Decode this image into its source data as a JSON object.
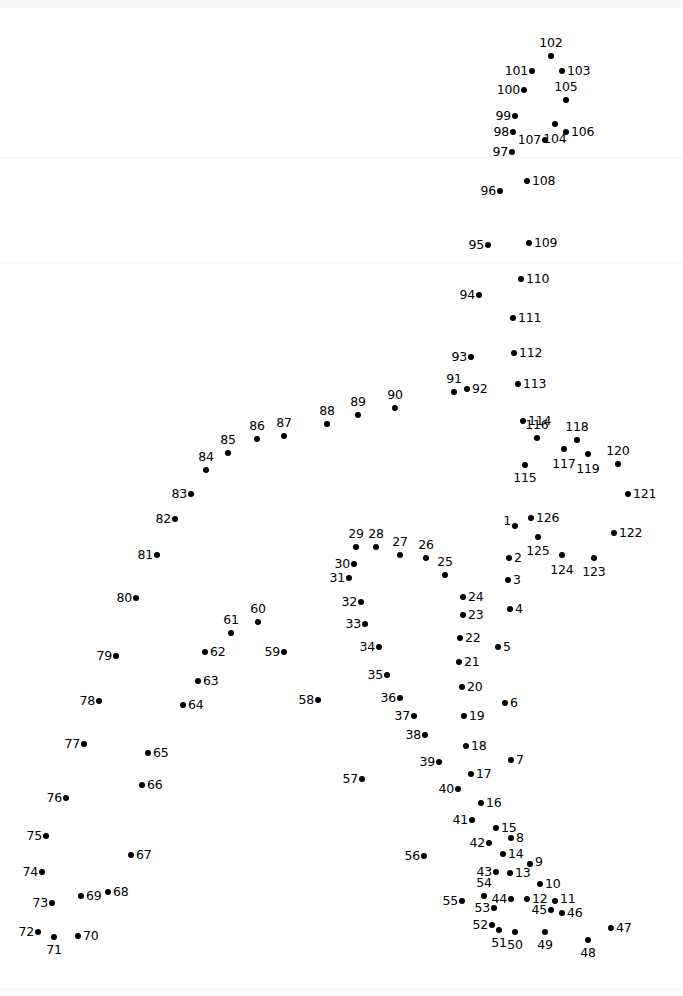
{
  "page": {
    "type": "connect-the-dots-puzzle",
    "width": 683,
    "height": 996,
    "background_color": "#ffffff",
    "dot_color": "#000000",
    "label_color": "#000000",
    "total_dots": 126
  },
  "dots": [
    {
      "n": "1",
      "x": 515,
      "y": 526,
      "lx": 511,
      "ly": 521,
      "pos": "left"
    },
    {
      "n": "2",
      "x": 509,
      "y": 558,
      "lx": 514,
      "ly": 558,
      "pos": "right"
    },
    {
      "n": "3",
      "x": 508,
      "y": 580,
      "lx": 513,
      "ly": 580,
      "pos": "right"
    },
    {
      "n": "4",
      "x": 510,
      "y": 609,
      "lx": 515,
      "ly": 609,
      "pos": "right"
    },
    {
      "n": "5",
      "x": 498,
      "y": 647,
      "lx": 503,
      "ly": 647,
      "pos": "right"
    },
    {
      "n": "6",
      "x": 505,
      "y": 703,
      "lx": 510,
      "ly": 703,
      "pos": "right"
    },
    {
      "n": "7",
      "x": 511,
      "y": 760,
      "lx": 516,
      "ly": 760,
      "pos": "right"
    },
    {
      "n": "8",
      "x": 511,
      "y": 838,
      "lx": 516,
      "ly": 838,
      "pos": "right"
    },
    {
      "n": "9",
      "x": 530,
      "y": 864,
      "lx": 535,
      "ly": 862,
      "pos": "right"
    },
    {
      "n": "10",
      "x": 540,
      "y": 884,
      "lx": 545,
      "ly": 884,
      "pos": "right"
    },
    {
      "n": "11",
      "x": 555,
      "y": 901,
      "lx": 560,
      "ly": 899,
      "pos": "right"
    },
    {
      "n": "12",
      "x": 527,
      "y": 899,
      "lx": 532,
      "ly": 899,
      "pos": "right"
    },
    {
      "n": "13",
      "x": 510,
      "y": 873,
      "lx": 515,
      "ly": 873,
      "pos": "right"
    },
    {
      "n": "14",
      "x": 503,
      "y": 854,
      "lx": 508,
      "ly": 854,
      "pos": "right"
    },
    {
      "n": "15",
      "x": 496,
      "y": 828,
      "lx": 501,
      "ly": 828,
      "pos": "right"
    },
    {
      "n": "16",
      "x": 481,
      "y": 803,
      "lx": 486,
      "ly": 803,
      "pos": "right"
    },
    {
      "n": "17",
      "x": 471,
      "y": 774,
      "lx": 476,
      "ly": 774,
      "pos": "right"
    },
    {
      "n": "18",
      "x": 466,
      "y": 746,
      "lx": 471,
      "ly": 746,
      "pos": "right"
    },
    {
      "n": "19",
      "x": 464,
      "y": 716,
      "lx": 469,
      "ly": 716,
      "pos": "right"
    },
    {
      "n": "20",
      "x": 462,
      "y": 687,
      "lx": 467,
      "ly": 687,
      "pos": "right"
    },
    {
      "n": "21",
      "x": 459,
      "y": 662,
      "lx": 464,
      "ly": 662,
      "pos": "right"
    },
    {
      "n": "22",
      "x": 460,
      "y": 638,
      "lx": 465,
      "ly": 638,
      "pos": "right"
    },
    {
      "n": "23",
      "x": 463,
      "y": 615,
      "lx": 468,
      "ly": 615,
      "pos": "right"
    },
    {
      "n": "24",
      "x": 463,
      "y": 597,
      "lx": 468,
      "ly": 597,
      "pos": "right"
    },
    {
      "n": "25",
      "x": 445,
      "y": 575,
      "lx": 445,
      "ly": 568,
      "pos": "above"
    },
    {
      "n": "26",
      "x": 426,
      "y": 558,
      "lx": 426,
      "ly": 551,
      "pos": "above"
    },
    {
      "n": "27",
      "x": 400,
      "y": 555,
      "lx": 400,
      "ly": 548,
      "pos": "above"
    },
    {
      "n": "28",
      "x": 376,
      "y": 547,
      "lx": 376,
      "ly": 540,
      "pos": "above"
    },
    {
      "n": "29",
      "x": 356,
      "y": 547,
      "lx": 356,
      "ly": 540,
      "pos": "above"
    },
    {
      "n": "30",
      "x": 354,
      "y": 564,
      "lx": 350,
      "ly": 564,
      "pos": "left"
    },
    {
      "n": "31",
      "x": 349,
      "y": 578,
      "lx": 345,
      "ly": 578,
      "pos": "left"
    },
    {
      "n": "32",
      "x": 361,
      "y": 602,
      "lx": 357,
      "ly": 602,
      "pos": "left"
    },
    {
      "n": "33",
      "x": 365,
      "y": 624,
      "lx": 361,
      "ly": 624,
      "pos": "left"
    },
    {
      "n": "34",
      "x": 379,
      "y": 647,
      "lx": 375,
      "ly": 647,
      "pos": "left"
    },
    {
      "n": "35",
      "x": 387,
      "y": 675,
      "lx": 383,
      "ly": 675,
      "pos": "left"
    },
    {
      "n": "36",
      "x": 400,
      "y": 698,
      "lx": 396,
      "ly": 698,
      "pos": "left"
    },
    {
      "n": "37",
      "x": 414,
      "y": 716,
      "lx": 410,
      "ly": 716,
      "pos": "left"
    },
    {
      "n": "38",
      "x": 425,
      "y": 735,
      "lx": 421,
      "ly": 735,
      "pos": "left"
    },
    {
      "n": "39",
      "x": 439,
      "y": 762,
      "lx": 435,
      "ly": 762,
      "pos": "left"
    },
    {
      "n": "40",
      "x": 458,
      "y": 789,
      "lx": 454,
      "ly": 789,
      "pos": "left"
    },
    {
      "n": "41",
      "x": 472,
      "y": 820,
      "lx": 468,
      "ly": 820,
      "pos": "left"
    },
    {
      "n": "42",
      "x": 489,
      "y": 843,
      "lx": 485,
      "ly": 843,
      "pos": "left"
    },
    {
      "n": "43",
      "x": 496,
      "y": 872,
      "lx": 492,
      "ly": 872,
      "pos": "left"
    },
    {
      "n": "44",
      "x": 511,
      "y": 899,
      "lx": 507,
      "ly": 899,
      "pos": "left"
    },
    {
      "n": "45",
      "x": 551,
      "y": 910,
      "lx": 547,
      "ly": 910,
      "pos": "left"
    },
    {
      "n": "46",
      "x": 562,
      "y": 913,
      "lx": 567,
      "ly": 913,
      "pos": "right"
    },
    {
      "n": "47",
      "x": 611,
      "y": 928,
      "lx": 616,
      "ly": 928,
      "pos": "right"
    },
    {
      "n": "48",
      "x": 588,
      "y": 940,
      "lx": 588,
      "ly": 947,
      "pos": "below"
    },
    {
      "n": "49",
      "x": 545,
      "y": 932,
      "lx": 545,
      "ly": 939,
      "pos": "below"
    },
    {
      "n": "50",
      "x": 515,
      "y": 932,
      "lx": 515,
      "ly": 939,
      "pos": "below"
    },
    {
      "n": "51",
      "x": 499,
      "y": 930,
      "lx": 499,
      "ly": 937,
      "pos": "below"
    },
    {
      "n": "52",
      "x": 492,
      "y": 925,
      "lx": 488,
      "ly": 925,
      "pos": "left"
    },
    {
      "n": "53",
      "x": 494,
      "y": 908,
      "lx": 490,
      "ly": 908,
      "pos": "left"
    },
    {
      "n": "54",
      "x": 484,
      "y": 896,
      "lx": 484,
      "ly": 889,
      "pos": "above"
    },
    {
      "n": "55",
      "x": 462,
      "y": 901,
      "lx": 458,
      "ly": 901,
      "pos": "left"
    },
    {
      "n": "56",
      "x": 424,
      "y": 856,
      "lx": 420,
      "ly": 856,
      "pos": "left"
    },
    {
      "n": "57",
      "x": 362,
      "y": 779,
      "lx": 358,
      "ly": 779,
      "pos": "left"
    },
    {
      "n": "58",
      "x": 318,
      "y": 700,
      "lx": 314,
      "ly": 700,
      "pos": "left"
    },
    {
      "n": "59",
      "x": 284,
      "y": 652,
      "lx": 280,
      "ly": 652,
      "pos": "left"
    },
    {
      "n": "60",
      "x": 258,
      "y": 622,
      "lx": 258,
      "ly": 615,
      "pos": "above"
    },
    {
      "n": "61",
      "x": 231,
      "y": 633,
      "lx": 231,
      "ly": 626,
      "pos": "above"
    },
    {
      "n": "62",
      "x": 205,
      "y": 652,
      "lx": 210,
      "ly": 652,
      "pos": "right"
    },
    {
      "n": "63",
      "x": 198,
      "y": 681,
      "lx": 203,
      "ly": 681,
      "pos": "right"
    },
    {
      "n": "64",
      "x": 183,
      "y": 705,
      "lx": 188,
      "ly": 705,
      "pos": "right"
    },
    {
      "n": "65",
      "x": 148,
      "y": 753,
      "lx": 153,
      "ly": 753,
      "pos": "right"
    },
    {
      "n": "66",
      "x": 142,
      "y": 785,
      "lx": 147,
      "ly": 785,
      "pos": "right"
    },
    {
      "n": "67",
      "x": 131,
      "y": 855,
      "lx": 136,
      "ly": 855,
      "pos": "right"
    },
    {
      "n": "68",
      "x": 108,
      "y": 892,
      "lx": 113,
      "ly": 892,
      "pos": "right"
    },
    {
      "n": "69",
      "x": 81,
      "y": 896,
      "lx": 86,
      "ly": 896,
      "pos": "right"
    },
    {
      "n": "70",
      "x": 78,
      "y": 936,
      "lx": 83,
      "ly": 936,
      "pos": "right"
    },
    {
      "n": "71",
      "x": 54,
      "y": 937,
      "lx": 54,
      "ly": 944,
      "pos": "below"
    },
    {
      "n": "72",
      "x": 38,
      "y": 932,
      "lx": 34,
      "ly": 932,
      "pos": "left"
    },
    {
      "n": "73",
      "x": 52,
      "y": 903,
      "lx": 48,
      "ly": 903,
      "pos": "left"
    },
    {
      "n": "74",
      "x": 42,
      "y": 872,
      "lx": 38,
      "ly": 872,
      "pos": "left"
    },
    {
      "n": "75",
      "x": 46,
      "y": 836,
      "lx": 42,
      "ly": 836,
      "pos": "left"
    },
    {
      "n": "76",
      "x": 66,
      "y": 798,
      "lx": 62,
      "ly": 798,
      "pos": "left"
    },
    {
      "n": "77",
      "x": 84,
      "y": 744,
      "lx": 80,
      "ly": 744,
      "pos": "left"
    },
    {
      "n": "78",
      "x": 99,
      "y": 701,
      "lx": 95,
      "ly": 701,
      "pos": "left"
    },
    {
      "n": "79",
      "x": 116,
      "y": 656,
      "lx": 112,
      "ly": 656,
      "pos": "left"
    },
    {
      "n": "80",
      "x": 136,
      "y": 598,
      "lx": 132,
      "ly": 598,
      "pos": "left"
    },
    {
      "n": "81",
      "x": 157,
      "y": 555,
      "lx": 153,
      "ly": 555,
      "pos": "left"
    },
    {
      "n": "82",
      "x": 175,
      "y": 519,
      "lx": 171,
      "ly": 519,
      "pos": "left"
    },
    {
      "n": "83",
      "x": 191,
      "y": 494,
      "lx": 187,
      "ly": 494,
      "pos": "left"
    },
    {
      "n": "84",
      "x": 206,
      "y": 470,
      "lx": 206,
      "ly": 463,
      "pos": "above"
    },
    {
      "n": "85",
      "x": 228,
      "y": 453,
      "lx": 228,
      "ly": 446,
      "pos": "above"
    },
    {
      "n": "86",
      "x": 257,
      "y": 439,
      "lx": 257,
      "ly": 432,
      "pos": "above"
    },
    {
      "n": "87",
      "x": 284,
      "y": 436,
      "lx": 284,
      "ly": 429,
      "pos": "above"
    },
    {
      "n": "88",
      "x": 327,
      "y": 424,
      "lx": 327,
      "ly": 417,
      "pos": "above"
    },
    {
      "n": "89",
      "x": 358,
      "y": 415,
      "lx": 358,
      "ly": 408,
      "pos": "above"
    },
    {
      "n": "90",
      "x": 395,
      "y": 408,
      "lx": 395,
      "ly": 401,
      "pos": "above"
    },
    {
      "n": "91",
      "x": 454,
      "y": 392,
      "lx": 454,
      "ly": 385,
      "pos": "above"
    },
    {
      "n": "92",
      "x": 467,
      "y": 389,
      "lx": 472,
      "ly": 389,
      "pos": "right"
    },
    {
      "n": "93",
      "x": 471,
      "y": 357,
      "lx": 467,
      "ly": 357,
      "pos": "left"
    },
    {
      "n": "94",
      "x": 479,
      "y": 295,
      "lx": 475,
      "ly": 295,
      "pos": "left"
    },
    {
      "n": "95",
      "x": 488,
      "y": 245,
      "lx": 484,
      "ly": 245,
      "pos": "left"
    },
    {
      "n": "96",
      "x": 500,
      "y": 191,
      "lx": 496,
      "ly": 191,
      "pos": "left"
    },
    {
      "n": "97",
      "x": 512,
      "y": 152,
      "lx": 508,
      "ly": 152,
      "pos": "left"
    },
    {
      "n": "98",
      "x": 513,
      "y": 132,
      "lx": 509,
      "ly": 132,
      "pos": "left"
    },
    {
      "n": "99",
      "x": 515,
      "y": 116,
      "lx": 511,
      "ly": 116,
      "pos": "left"
    },
    {
      "n": "100",
      "x": 524,
      "y": 90,
      "lx": 520,
      "ly": 90,
      "pos": "left"
    },
    {
      "n": "101",
      "x": 532,
      "y": 71,
      "lx": 528,
      "ly": 71,
      "pos": "left"
    },
    {
      "n": "102",
      "x": 551,
      "y": 56,
      "lx": 551,
      "ly": 49,
      "pos": "above"
    },
    {
      "n": "103",
      "x": 562,
      "y": 71,
      "lx": 567,
      "ly": 71,
      "pos": "right"
    },
    {
      "n": "104",
      "x": 555,
      "y": 124,
      "lx": 555,
      "ly": 133,
      "pos": "below"
    },
    {
      "n": "105",
      "x": 566,
      "y": 100,
      "lx": 566,
      "ly": 93,
      "pos": "above"
    },
    {
      "n": "106",
      "x": 566,
      "y": 132,
      "lx": 571,
      "ly": 132,
      "pos": "right"
    },
    {
      "n": "107",
      "x": 545,
      "y": 140,
      "lx": 541,
      "ly": 140,
      "pos": "left"
    },
    {
      "n": "108",
      "x": 527,
      "y": 181,
      "lx": 532,
      "ly": 181,
      "pos": "right"
    },
    {
      "n": "109",
      "x": 529,
      "y": 243,
      "lx": 534,
      "ly": 243,
      "pos": "right"
    },
    {
      "n": "110",
      "x": 521,
      "y": 279,
      "lx": 526,
      "ly": 279,
      "pos": "right"
    },
    {
      "n": "111",
      "x": 513,
      "y": 318,
      "lx": 518,
      "ly": 318,
      "pos": "right"
    },
    {
      "n": "112",
      "x": 514,
      "y": 353,
      "lx": 519,
      "ly": 353,
      "pos": "right"
    },
    {
      "n": "113",
      "x": 518,
      "y": 384,
      "lx": 523,
      "ly": 384,
      "pos": "right"
    },
    {
      "n": "114",
      "x": 523,
      "y": 421,
      "lx": 528,
      "ly": 421,
      "pos": "right"
    },
    {
      "n": "115",
      "x": 525,
      "y": 465,
      "lx": 525,
      "ly": 472,
      "pos": "below"
    },
    {
      "n": "116",
      "x": 537,
      "y": 438,
      "lx": 537,
      "ly": 431,
      "pos": "above"
    },
    {
      "n": "117",
      "x": 564,
      "y": 449,
      "lx": 564,
      "ly": 458,
      "pos": "below"
    },
    {
      "n": "118",
      "x": 577,
      "y": 440,
      "lx": 577,
      "ly": 433,
      "pos": "above"
    },
    {
      "n": "119",
      "x": 588,
      "y": 454,
      "lx": 588,
      "ly": 463,
      "pos": "below"
    },
    {
      "n": "120",
      "x": 618,
      "y": 464,
      "lx": 618,
      "ly": 457,
      "pos": "above"
    },
    {
      "n": "121",
      "x": 628,
      "y": 494,
      "lx": 633,
      "ly": 494,
      "pos": "right"
    },
    {
      "n": "122",
      "x": 614,
      "y": 533,
      "lx": 619,
      "ly": 533,
      "pos": "right"
    },
    {
      "n": "123",
      "x": 594,
      "y": 558,
      "lx": 594,
      "ly": 566,
      "pos": "below"
    },
    {
      "n": "124",
      "x": 562,
      "y": 555,
      "lx": 562,
      "ly": 564,
      "pos": "below"
    },
    {
      "n": "125",
      "x": 538,
      "y": 537,
      "lx": 538,
      "ly": 545,
      "pos": "below"
    },
    {
      "n": "126",
      "x": 531,
      "y": 518,
      "lx": 536,
      "ly": 518,
      "pos": "right"
    }
  ]
}
